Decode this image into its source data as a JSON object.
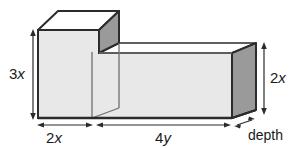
{
  "figure": {
    "kind": "3d-solid-diagram",
    "background_color": "#ffffff",
    "colors": {
      "front_face": "#e8e8e8",
      "top_face": "#ffffff",
      "side_face": "#9a9a9a",
      "outline": "#2b2b2b",
      "inner_line": "#6f6f6f",
      "text": "#1a1a1a",
      "dimension_line": "#2b2b2b"
    },
    "labels": {
      "height_left": {
        "coefficient": "3",
        "variable": "x",
        "text": "3x"
      },
      "height_right": {
        "coefficient": "2",
        "variable": "x",
        "text": "2x"
      },
      "width_left": {
        "coefficient": "2",
        "variable": "x",
        "text": "2x"
      },
      "width_right": {
        "coefficient": "4",
        "variable": "y",
        "text": "4y"
      },
      "depth": {
        "text": "depth"
      }
    },
    "dimensions": [
      {
        "name": "left-height",
        "label": "3x",
        "orientation": "vertical",
        "position": "left"
      },
      {
        "name": "right-height",
        "label": "2x",
        "orientation": "vertical",
        "position": "right"
      },
      {
        "name": "left-width",
        "label": "2x",
        "orientation": "horizontal",
        "position": "bottom-left"
      },
      {
        "name": "right-width",
        "label": "4y",
        "orientation": "horizontal",
        "position": "bottom-right"
      },
      {
        "name": "depth",
        "label": "depth",
        "orientation": "diagonal",
        "position": "bottom-right-corner"
      }
    ]
  }
}
